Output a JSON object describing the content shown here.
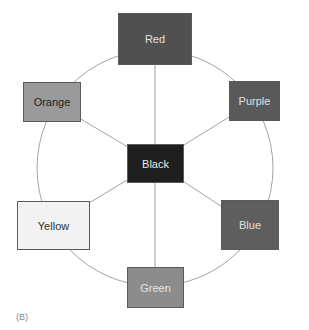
{
  "diagram": {
    "caption": "(B)",
    "center": {
      "label": "Black",
      "fill": "#1e1e1e",
      "text_color": "#e8e8e8"
    },
    "nodes": [
      {
        "label": "Red",
        "fill": "#505050",
        "text_color": "#e0e0e0"
      },
      {
        "label": "Purple",
        "fill": "#595959",
        "text_color": "#e0e0e0"
      },
      {
        "label": "Blue",
        "fill": "#5e5e5e",
        "text_color": "#e0e0e0"
      },
      {
        "label": "Green",
        "fill": "#8c8c8c",
        "text_color": "#e6e6e6"
      },
      {
        "label": "Yellow",
        "fill": "#f2f2f2",
        "text_color": "#333333"
      },
      {
        "label": "Orange",
        "fill": "#9a9a9a",
        "text_color": "#222222"
      }
    ],
    "edges": [
      [
        "Black",
        "Red"
      ],
      [
        "Black",
        "Purple"
      ],
      [
        "Black",
        "Blue"
      ],
      [
        "Black",
        "Green"
      ],
      [
        "Black",
        "Yellow"
      ],
      [
        "Black",
        "Orange"
      ]
    ],
    "ring": {
      "shape": "circle",
      "connects": [
        "Red",
        "Purple",
        "Blue",
        "Green",
        "Yellow",
        "Orange"
      ]
    }
  }
}
